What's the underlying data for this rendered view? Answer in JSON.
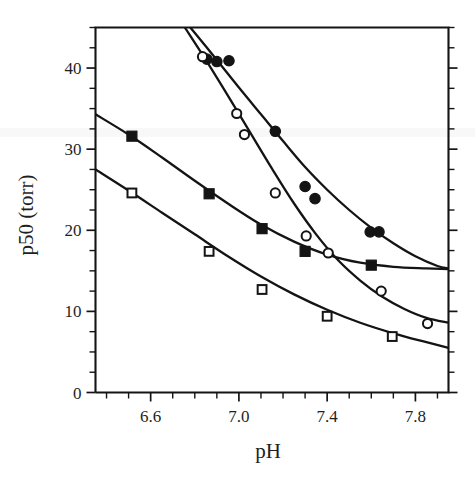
{
  "chart_data": {
    "type": "scatter",
    "title": "",
    "xlabel": "pH",
    "ylabel": "p50 (torr)",
    "xlim": [
      6.35,
      7.95
    ],
    "ylim": [
      0,
      45
    ],
    "grid": false,
    "legend": "none",
    "x_ticks": [
      6.6,
      7.0,
      7.4,
      7.8
    ],
    "x_tick_labels": [
      "6.6",
      "7.0",
      "7.4",
      "7.8"
    ],
    "x_minor_step": 0.1,
    "y_ticks": [
      0,
      10,
      20,
      30,
      40
    ],
    "y_tick_labels": [
      "0",
      "10",
      "20",
      "30",
      "40"
    ],
    "y_minor_step": 2.5,
    "series": [
      {
        "name": "filled-circles",
        "marker": "filled-circle",
        "points": [
          {
            "x": 6.855,
            "y": 41.1
          },
          {
            "x": 6.9,
            "y": 40.8
          },
          {
            "x": 6.955,
            "y": 40.9
          },
          {
            "x": 7.165,
            "y": 32.2
          },
          {
            "x": 7.3,
            "y": 25.4
          },
          {
            "x": 7.345,
            "y": 23.9
          },
          {
            "x": 7.595,
            "y": 19.8
          },
          {
            "x": 7.635,
            "y": 19.8
          }
        ],
        "fit_curve": [
          {
            "x": 6.78,
            "y": 45.0
          },
          {
            "x": 6.9,
            "y": 41.0
          },
          {
            "x": 7.0,
            "y": 37.6
          },
          {
            "x": 7.1,
            "y": 34.3
          },
          {
            "x": 7.2,
            "y": 31.0
          },
          {
            "x": 7.3,
            "y": 27.8
          },
          {
            "x": 7.4,
            "y": 25.0
          },
          {
            "x": 7.5,
            "y": 22.5
          },
          {
            "x": 7.6,
            "y": 20.3
          },
          {
            "x": 7.7,
            "y": 18.4
          },
          {
            "x": 7.8,
            "y": 16.8
          },
          {
            "x": 7.9,
            "y": 15.6
          },
          {
            "x": 7.95,
            "y": 15.3
          }
        ]
      },
      {
        "name": "open-circles",
        "marker": "open-circle",
        "points": [
          {
            "x": 6.835,
            "y": 41.4
          },
          {
            "x": 6.99,
            "y": 34.4
          },
          {
            "x": 7.025,
            "y": 31.8
          },
          {
            "x": 7.165,
            "y": 24.6
          },
          {
            "x": 7.305,
            "y": 19.3
          },
          {
            "x": 7.405,
            "y": 17.2
          },
          {
            "x": 7.645,
            "y": 12.5
          },
          {
            "x": 7.855,
            "y": 8.5
          }
        ],
        "fit_curve": [
          {
            "x": 6.755,
            "y": 45.0
          },
          {
            "x": 6.85,
            "y": 41.0
          },
          {
            "x": 6.95,
            "y": 36.6
          },
          {
            "x": 7.05,
            "y": 32.1
          },
          {
            "x": 7.15,
            "y": 27.6
          },
          {
            "x": 7.25,
            "y": 23.3
          },
          {
            "x": 7.35,
            "y": 19.5
          },
          {
            "x": 7.45,
            "y": 16.3
          },
          {
            "x": 7.55,
            "y": 13.8
          },
          {
            "x": 7.65,
            "y": 11.8
          },
          {
            "x": 7.75,
            "y": 10.3
          },
          {
            "x": 7.85,
            "y": 9.2
          },
          {
            "x": 7.95,
            "y": 8.6
          }
        ]
      },
      {
        "name": "filled-squares",
        "marker": "filled-square",
        "points": [
          {
            "x": 6.515,
            "y": 31.6
          },
          {
            "x": 6.865,
            "y": 24.5
          },
          {
            "x": 7.105,
            "y": 20.2
          },
          {
            "x": 7.3,
            "y": 17.4
          },
          {
            "x": 7.6,
            "y": 15.7
          }
        ],
        "fit_curve": [
          {
            "x": 6.35,
            "y": 34.3
          },
          {
            "x": 6.5,
            "y": 31.8
          },
          {
            "x": 6.65,
            "y": 29.0
          },
          {
            "x": 6.8,
            "y": 26.1
          },
          {
            "x": 6.95,
            "y": 23.3
          },
          {
            "x": 7.1,
            "y": 20.7
          },
          {
            "x": 7.25,
            "y": 18.6
          },
          {
            "x": 7.4,
            "y": 17.0
          },
          {
            "x": 7.55,
            "y": 16.0
          },
          {
            "x": 7.7,
            "y": 15.5
          },
          {
            "x": 7.85,
            "y": 15.3
          },
          {
            "x": 7.95,
            "y": 15.2
          }
        ]
      },
      {
        "name": "open-squares",
        "marker": "open-square",
        "points": [
          {
            "x": 6.515,
            "y": 24.6
          },
          {
            "x": 6.865,
            "y": 17.4
          },
          {
            "x": 7.105,
            "y": 12.7
          },
          {
            "x": 7.4,
            "y": 9.4
          },
          {
            "x": 7.695,
            "y": 6.9
          }
        ],
        "fit_curve": [
          {
            "x": 6.35,
            "y": 27.5
          },
          {
            "x": 6.5,
            "y": 24.9
          },
          {
            "x": 6.65,
            "y": 22.2
          },
          {
            "x": 6.8,
            "y": 19.5
          },
          {
            "x": 6.95,
            "y": 16.8
          },
          {
            "x": 7.1,
            "y": 14.3
          },
          {
            "x": 7.25,
            "y": 12.1
          },
          {
            "x": 7.4,
            "y": 10.2
          },
          {
            "x": 7.55,
            "y": 8.6
          },
          {
            "x": 7.7,
            "y": 7.3
          },
          {
            "x": 7.85,
            "y": 6.2
          },
          {
            "x": 7.95,
            "y": 5.5
          }
        ]
      }
    ]
  },
  "figure": {
    "background": "#ffffff",
    "ink_color": "#141414"
  }
}
